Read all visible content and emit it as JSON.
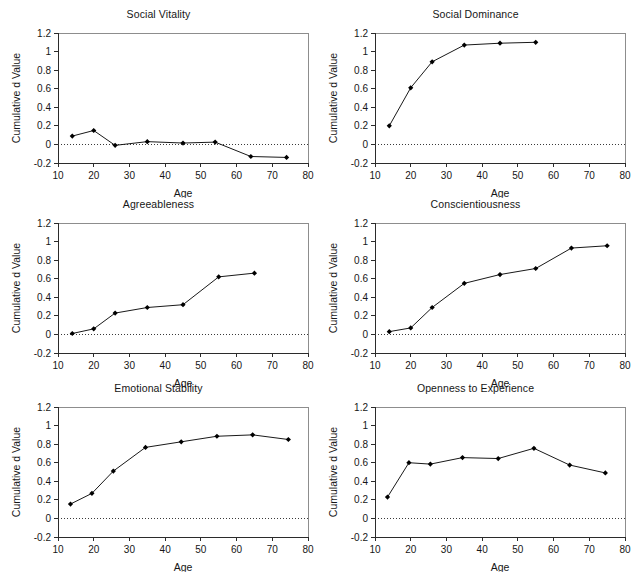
{
  "figure": {
    "panel_count": 6,
    "xlabel": "Age",
    "ylabel": "Cumulative d Value",
    "xticks": [
      "10",
      "20",
      "30",
      "40",
      "50",
      "60",
      "70",
      "80"
    ],
    "yticks": [
      "1.2",
      "1",
      "0.8",
      "0.6",
      "0.4",
      "0.2",
      "0",
      "-0.2"
    ],
    "line_color": "#191919",
    "marker_color": "#000000",
    "frame_color": "#8d8d8d",
    "axis_color": "#2b2b2b",
    "background": "#ffffff"
  },
  "panels": [
    {
      "title": "Social Vitality"
    },
    {
      "title": "Social Dominance"
    },
    {
      "title": "Agreeableness"
    },
    {
      "title": "Conscientiousness"
    },
    {
      "title": "Emotional Stability"
    },
    {
      "title": "Openness to Experience"
    }
  ],
  "chart_data": [
    {
      "type": "line",
      "title": "Social Vitality",
      "xlabel": "Age",
      "ylabel": "Cumulative d Value",
      "xlim": [
        10,
        80
      ],
      "ylim": [
        -0.2,
        1.2
      ],
      "xticks": [
        10,
        20,
        30,
        40,
        50,
        60,
        70,
        80
      ],
      "yticks": [
        -0.2,
        0,
        0.2,
        0.4,
        0.6,
        0.8,
        1,
        1.2
      ],
      "grid": false,
      "legend": "none",
      "reference_line": 0,
      "x": [
        14,
        20,
        26,
        35,
        45,
        54,
        64,
        74
      ],
      "values": [
        0.09,
        0.15,
        -0.01,
        0.03,
        0.015,
        0.025,
        -0.13,
        -0.14
      ]
    },
    {
      "type": "line",
      "title": "Social Dominance",
      "xlabel": "Age",
      "ylabel": "Cumulative d Value",
      "xlim": [
        10,
        80
      ],
      "ylim": [
        -0.2,
        1.2
      ],
      "xticks": [
        10,
        20,
        30,
        40,
        50,
        60,
        70,
        80
      ],
      "yticks": [
        -0.2,
        0,
        0.2,
        0.4,
        0.6,
        0.8,
        1,
        1.2
      ],
      "grid": false,
      "legend": "none",
      "reference_line": 0,
      "x": [
        14,
        20,
        26,
        35,
        45,
        55
      ],
      "values": [
        0.2,
        0.61,
        0.89,
        1.07,
        1.09,
        1.1
      ]
    },
    {
      "type": "line",
      "title": "Agreeableness",
      "xlabel": "Age",
      "ylabel": "Cumulative d Value",
      "xlim": [
        10,
        80
      ],
      "ylim": [
        -0.2,
        1.2
      ],
      "xticks": [
        10,
        20,
        30,
        40,
        50,
        60,
        70,
        80
      ],
      "yticks": [
        -0.2,
        0,
        0.2,
        0.4,
        0.6,
        0.8,
        1,
        1.2
      ],
      "grid": false,
      "legend": "none",
      "reference_line": 0,
      "x": [
        14,
        20,
        26,
        35,
        45,
        55,
        65
      ],
      "values": [
        0.01,
        0.06,
        0.23,
        0.29,
        0.32,
        0.62,
        0.66
      ]
    },
    {
      "type": "line",
      "title": "Conscientiousness",
      "xlabel": "Age",
      "ylabel": "Cumulative d Value",
      "xlim": [
        10,
        80
      ],
      "ylim": [
        -0.2,
        1.2
      ],
      "xticks": [
        10,
        20,
        30,
        40,
        50,
        60,
        70,
        80
      ],
      "yticks": [
        -0.2,
        0,
        0.2,
        0.4,
        0.6,
        0.8,
        1,
        1.2
      ],
      "grid": false,
      "legend": "none",
      "reference_line": 0,
      "x": [
        14,
        20,
        26,
        35,
        45,
        55,
        65,
        75
      ],
      "values": [
        0.03,
        0.07,
        0.29,
        0.55,
        0.645,
        0.71,
        0.93,
        0.955
      ]
    },
    {
      "type": "line",
      "title": "Emotional Stability",
      "xlabel": "Age",
      "ylabel": "Cumulative d Value",
      "xlim": [
        10,
        80
      ],
      "ylim": [
        -0.2,
        1.2
      ],
      "xticks": [
        10,
        20,
        30,
        40,
        50,
        60,
        70,
        80
      ],
      "yticks": [
        -0.2,
        0,
        0.2,
        0.4,
        0.6,
        0.8,
        1,
        1.2
      ],
      "grid": false,
      "legend": "none",
      "reference_line": 0,
      "x": [
        13.5,
        19.5,
        25.5,
        34.5,
        44.5,
        54.5,
        64.5,
        74.5
      ],
      "values": [
        0.155,
        0.27,
        0.51,
        0.765,
        0.825,
        0.885,
        0.9,
        0.85
      ]
    },
    {
      "type": "line",
      "title": "Openness to Experience",
      "xlabel": "Age",
      "ylabel": "Cumulative d Value",
      "xlim": [
        10,
        80
      ],
      "ylim": [
        -0.2,
        1.2
      ],
      "xticks": [
        10,
        20,
        30,
        40,
        50,
        60,
        70,
        80
      ],
      "yticks": [
        -0.2,
        0,
        0.2,
        0.4,
        0.6,
        0.8,
        1,
        1.2
      ],
      "grid": false,
      "legend": "none",
      "reference_line": 0,
      "x": [
        13.5,
        19.5,
        25.5,
        34.5,
        44.5,
        54.5,
        64.5,
        74.5
      ],
      "values": [
        0.23,
        0.6,
        0.585,
        0.655,
        0.645,
        0.755,
        0.575,
        0.49
      ]
    }
  ]
}
